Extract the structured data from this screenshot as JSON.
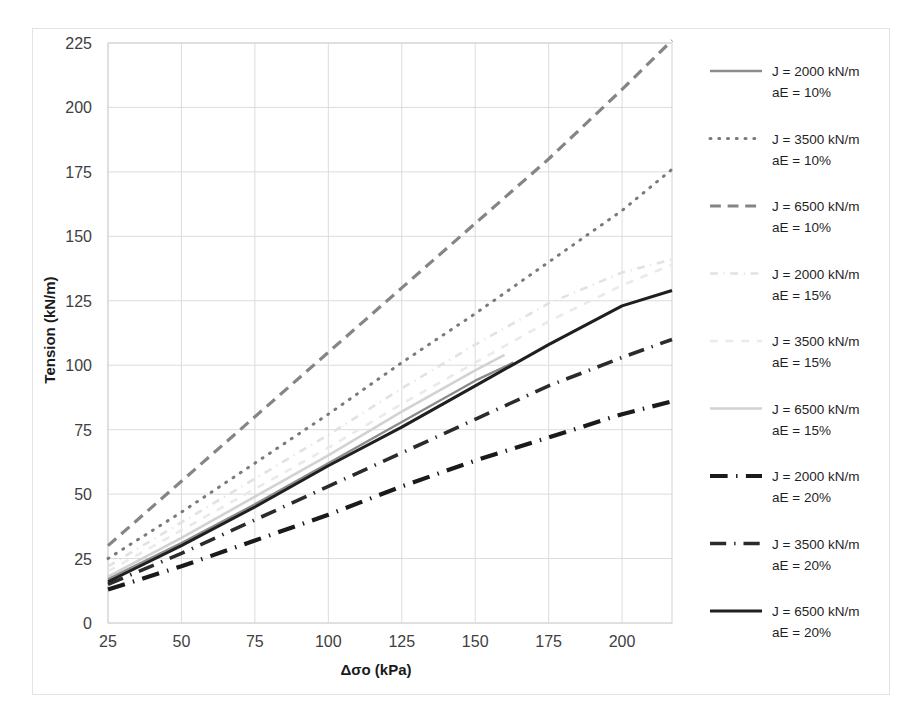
{
  "chart_data": {
    "type": "line",
    "title": "",
    "xlabel": "Δσo (kPa)",
    "ylabel": "Tension (kN/m)",
    "xlim": [
      25,
      217
    ],
    "ylim": [
      0,
      225
    ],
    "xticks": [
      25,
      50,
      75,
      100,
      125,
      150,
      175,
      200
    ],
    "yticks": [
      0,
      25,
      50,
      75,
      100,
      125,
      150,
      175,
      200,
      225
    ],
    "grid": true,
    "legend_position": "right",
    "series": [
      {
        "name": "J = 2000 kN/m\naE = 10%",
        "label_line1": "J = 2000 kN/m",
        "label_line2": "aE = 10%",
        "style": "solid",
        "color": "#8c8c8c",
        "width": 2.4,
        "x": [
          25,
          50,
          75,
          100,
          125,
          150,
          163
        ],
        "y": [
          17,
          31,
          46,
          62,
          78,
          94,
          101
        ]
      },
      {
        "name": "J = 3500 kN/m\naE = 10%",
        "label_line1": "J = 3500 kN/m",
        "label_line2": "aE = 10%",
        "style": "dotted",
        "color": "#7a7a7a",
        "width": 3.0,
        "x": [
          25,
          50,
          75,
          100,
          125,
          150,
          175,
          200,
          217
        ],
        "y": [
          25,
          43,
          62,
          81,
          101,
          120,
          140,
          160,
          176
        ]
      },
      {
        "name": "J = 6500 kN/m\naE = 10%",
        "label_line1": "J = 6500 kN/m",
        "label_line2": "aE = 10%",
        "style": "dashed",
        "color": "#858585",
        "width": 3.2,
        "x": [
          25,
          50,
          75,
          100,
          125,
          150,
          175,
          200,
          217
        ],
        "y": [
          30,
          55,
          80,
          105,
          130,
          155,
          180,
          207,
          226
        ]
      },
      {
        "name": "J = 2000 kN/m\naE = 15%",
        "label_line1": "J = 2000 kN/m",
        "label_line2": "aE = 15%",
        "style": "dash-dot-light",
        "color": "#e2e2e2",
        "width": 2.6,
        "x": [
          25,
          50,
          75,
          100,
          125,
          150,
          175,
          200,
          217
        ],
        "y": [
          22,
          39,
          56,
          73,
          91,
          108,
          124,
          136,
          141
        ]
      },
      {
        "name": "J = 3500 kN/m\naE = 15%",
        "label_line1": "J = 3500 kN/m",
        "label_line2": "aE = 15%",
        "style": "dash-light",
        "color": "#eaeaea",
        "width": 2.6,
        "x": [
          25,
          50,
          75,
          100,
          125,
          150,
          175,
          200,
          217
        ],
        "y": [
          20,
          36,
          52,
          68,
          85,
          101,
          117,
          131,
          139
        ]
      },
      {
        "name": "J = 6500 kN/m\naE = 15%",
        "label_line1": "J = 6500 kN/m",
        "label_line2": "aE = 15%",
        "style": "solid-light",
        "color": "#d2d2d2",
        "width": 2.6,
        "x": [
          25,
          50,
          75,
          100,
          125,
          150,
          160
        ],
        "y": [
          18,
          33,
          49,
          65,
          82,
          98,
          104
        ]
      },
      {
        "name": "J = 2000 kN/m\naE = 20%",
        "label_line1": "J = 2000 kN/m",
        "label_line2": "aE = 20%",
        "style": "dash-dot",
        "color": "#1a1a1a",
        "width": 4.2,
        "x": [
          25,
          50,
          75,
          100,
          125,
          150,
          175,
          200,
          217
        ],
        "y": [
          13,
          22,
          32,
          42,
          53,
          63,
          72,
          81,
          86
        ]
      },
      {
        "name": "J = 3500 kN/m\naE = 20%",
        "label_line1": "J = 3500 kN/m",
        "label_line2": "aE = 20%",
        "style": "dash-dot-double",
        "color": "#2b2b2b",
        "width": 3.6,
        "x": [
          25,
          50,
          75,
          100,
          125,
          150,
          175,
          200,
          217
        ],
        "y": [
          15,
          27,
          40,
          53,
          66,
          79,
          92,
          103,
          110
        ]
      },
      {
        "name": "J = 6500 kN/m\naE = 20%",
        "label_line1": "J = 6500 kN/m",
        "label_line2": "aE = 20%",
        "style": "solid-dark",
        "color": "#1f1f1f",
        "width": 3.0,
        "x": [
          25,
          50,
          75,
          100,
          125,
          150,
          175,
          200,
          217
        ],
        "y": [
          16,
          30,
          45,
          61,
          76,
          92,
          108,
          123,
          129
        ]
      }
    ]
  }
}
